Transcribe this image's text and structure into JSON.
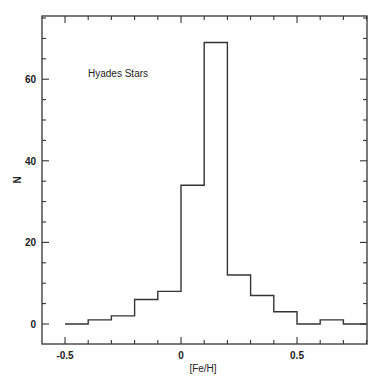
{
  "chart_data": {
    "type": "bar",
    "subtype": "step-histogram",
    "title": "",
    "annotation": "Hyades Stars",
    "xlabel": "[Fe/H]",
    "ylabel": "N",
    "xlim": [
      -0.6,
      0.8
    ],
    "ylim": [
      -5,
      76
    ],
    "x_ticks": [
      -0.5,
      0,
      0.5
    ],
    "x_tick_labels": [
      "-0.5",
      "0",
      "0.5"
    ],
    "x_minor_step": 0.1,
    "y_ticks": [
      0,
      20,
      40,
      60
    ],
    "y_tick_labels": [
      "0",
      "20",
      "40",
      "60"
    ],
    "y_minor_step": 5,
    "grid": false,
    "legend": null,
    "bin_edges": [
      -0.5,
      -0.4,
      -0.3,
      -0.2,
      -0.1,
      0.0,
      0.1,
      0.2,
      0.3,
      0.4,
      0.5,
      0.6,
      0.7,
      0.8
    ],
    "categories": [
      "-0.5–-0.4",
      "-0.4–-0.3",
      "-0.3–-0.2",
      "-0.2–-0.1",
      "-0.1–0.0",
      "0.0–0.1",
      "0.1–0.2",
      "0.2–0.3",
      "0.3–0.4",
      "0.4–0.5",
      "0.5–0.6",
      "0.6–0.7",
      "0.7–0.8"
    ],
    "values": [
      0,
      1,
      2,
      6,
      8,
      34,
      69,
      12,
      7,
      3,
      0,
      1,
      0
    ],
    "line_color": "#333333"
  }
}
